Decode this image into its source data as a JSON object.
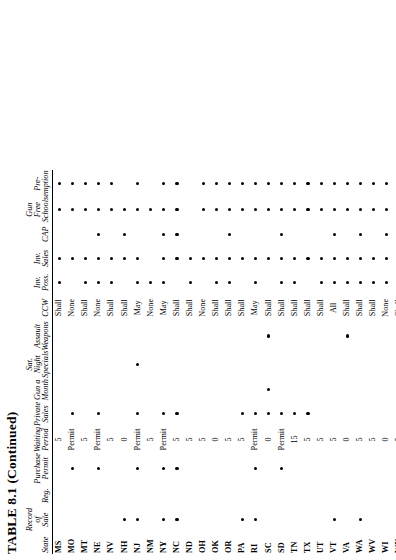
{
  "caption": "TABLE 8.1 (Continued)",
  "columns": [
    {
      "key": "state",
      "label": "State"
    },
    {
      "key": "record",
      "label": "Record\nof\nSale",
      "kind": "dot"
    },
    {
      "key": "reg",
      "label": "Reg.",
      "kind": "dot"
    },
    {
      "key": "permit",
      "label": "Purchase\nPermit",
      "kind": "dot"
    },
    {
      "key": "waiting",
      "label": "Waiting\nPeriod",
      "kind": "text"
    },
    {
      "key": "private",
      "label": "Private\nSales",
      "kind": "dot"
    },
    {
      "key": "gunmonth",
      "label": "Gun a\nMonth",
      "kind": "dot"
    },
    {
      "key": "satnight",
      "label": "Sat.\nNight\nSpecials",
      "kind": "dot"
    },
    {
      "key": "assault",
      "label": "Assault\nWeapons",
      "kind": "dot"
    },
    {
      "key": "ccw",
      "label": "CCW",
      "kind": "text"
    },
    {
      "key": "invposs",
      "label": "Inv.\nPoss.",
      "kind": "dot"
    },
    {
      "key": "invsales",
      "label": "Inv.\nSales",
      "kind": "dot"
    },
    {
      "key": "cap",
      "label": "CAP",
      "kind": "dot"
    },
    {
      "key": "gunfree",
      "label": "Gun\nFree\nSchools",
      "kind": "dot"
    },
    {
      "key": "preempt",
      "label": "Pre-\nemption",
      "kind": "dot"
    }
  ],
  "rows": [
    {
      "state": "MS",
      "record": 0,
      "reg": 0,
      "permit": 0,
      "waiting": "5",
      "private": 0,
      "gunmonth": 0,
      "satnight": 0,
      "assault": 0,
      "ccw": "Shall",
      "invposs": 1,
      "invsales": 1,
      "cap": 0,
      "gunfree": 1,
      "preempt": 1
    },
    {
      "state": "MO",
      "record": 0,
      "reg": 0,
      "permit": 1,
      "waiting": "Permit",
      "private": 1,
      "gunmonth": 0,
      "satnight": 0,
      "assault": 0,
      "ccw": "None",
      "invposs": 0,
      "invsales": 1,
      "cap": 0,
      "gunfree": 1,
      "preempt": 1
    },
    {
      "state": "MT",
      "record": 0,
      "reg": 0,
      "permit": 0,
      "waiting": "5",
      "private": 0,
      "gunmonth": 0,
      "satnight": 0,
      "assault": 0,
      "ccw": "Shall",
      "invposs": 1,
      "invsales": 1,
      "cap": 0,
      "gunfree": 1,
      "preempt": 1
    },
    {
      "state": "NE",
      "record": 0,
      "reg": 0,
      "permit": 1,
      "waiting": "Permit",
      "private": 1,
      "gunmonth": 0,
      "satnight": 0,
      "assault": 0,
      "ccw": "None",
      "invposs": 1,
      "invsales": 1,
      "cap": 1,
      "gunfree": 1,
      "preempt": 1
    },
    {
      "state": "NV",
      "record": 0,
      "reg": 0,
      "permit": 0,
      "waiting": "5",
      "private": 0,
      "gunmonth": 0,
      "satnight": 0,
      "assault": 0,
      "ccw": "Shall",
      "invposs": 1,
      "invsales": 1,
      "cap": 0,
      "gunfree": 1,
      "preempt": 1
    },
    {
      "state": "NH",
      "record": 1,
      "reg": 0,
      "permit": 0,
      "waiting": "0",
      "private": 0,
      "gunmonth": 0,
      "satnight": 0,
      "assault": 0,
      "ccw": "Shall",
      "invposs": 0,
      "invsales": 1,
      "cap": 1,
      "gunfree": 1,
      "preempt": 0
    },
    {
      "state": "NJ",
      "record": 1,
      "reg": 0,
      "permit": 1,
      "waiting": "Permit",
      "private": 1,
      "gunmonth": 0,
      "satnight": 1,
      "assault": 0,
      "ccw": "May",
      "invposs": 1,
      "invsales": 1,
      "cap": 0,
      "gunfree": 1,
      "preempt": 1
    },
    {
      "state": "NM",
      "record": 0,
      "reg": 0,
      "permit": 0,
      "waiting": "5",
      "private": 0,
      "gunmonth": 0,
      "satnight": 0,
      "assault": 0,
      "ccw": "None",
      "invposs": 1,
      "invsales": 0,
      "cap": 0,
      "gunfree": 1,
      "preempt": 0
    },
    {
      "state": "NY",
      "record": 1,
      "reg": 0,
      "permit": 1,
      "waiting": "Permit",
      "private": 1,
      "gunmonth": 0,
      "satnight": 0,
      "assault": 0,
      "ccw": "May",
      "invposs": 1,
      "invsales": 1,
      "cap": 1,
      "gunfree": 1,
      "preempt": 1
    },
    {
      "state": "NC",
      "record": 1,
      "reg": 0,
      "permit": 1,
      "waiting": "5",
      "private": 1,
      "gunmonth": 0,
      "satnight": 0,
      "assault": 0,
      "ccw": "Shall",
      "invposs": 0,
      "invsales": 1,
      "cap": 1,
      "gunfree": 1,
      "preempt": 1
    },
    {
      "state": "ND",
      "record": 0,
      "reg": 0,
      "permit": 0,
      "waiting": "5",
      "private": 0,
      "gunmonth": 0,
      "satnight": 0,
      "assault": 0,
      "ccw": "Shall",
      "invposs": 1,
      "invsales": 1,
      "cap": 0,
      "gunfree": 0,
      "preempt": 0
    },
    {
      "state": "OH",
      "record": 0,
      "reg": 0,
      "permit": 0,
      "waiting": "5",
      "private": 0,
      "gunmonth": 0,
      "satnight": 0,
      "assault": 0,
      "ccw": "None",
      "invposs": 0,
      "invsales": 1,
      "cap": 0,
      "gunfree": 1,
      "preempt": 1
    },
    {
      "state": "OK",
      "record": 0,
      "reg": 0,
      "permit": 0,
      "waiting": "0",
      "private": 0,
      "gunmonth": 0,
      "satnight": 0,
      "assault": 0,
      "ccw": "Shall",
      "invposs": 1,
      "invsales": 1,
      "cap": 0,
      "gunfree": 1,
      "preempt": 1
    },
    {
      "state": "OR",
      "record": 0,
      "reg": 0,
      "permit": 0,
      "waiting": "5",
      "private": 0,
      "gunmonth": 0,
      "satnight": 0,
      "assault": 0,
      "ccw": "Shall",
      "invposs": 1,
      "invsales": 1,
      "cap": 1,
      "gunfree": 1,
      "preempt": 1
    },
    {
      "state": "PA",
      "record": 1,
      "reg": 0,
      "permit": 0,
      "waiting": "5",
      "private": 1,
      "gunmonth": 0,
      "satnight": 0,
      "assault": 0,
      "ccw": "Shall",
      "invposs": 0,
      "invsales": 1,
      "cap": 0,
      "gunfree": 1,
      "preempt": 1
    },
    {
      "state": "RI",
      "record": 1,
      "reg": 0,
      "permit": 1,
      "waiting": "Permit",
      "private": 1,
      "gunmonth": 0,
      "satnight": 0,
      "assault": 0,
      "ccw": "May",
      "invposs": 1,
      "invsales": 1,
      "cap": 0,
      "gunfree": 1,
      "preempt": 1
    },
    {
      "state": "SC",
      "record": 0,
      "reg": 0,
      "permit": 0,
      "waiting": "0",
      "private": 1,
      "gunmonth": 1,
      "satnight": 0,
      "assault": 1,
      "ccw": "Shall",
      "invposs": 0,
      "invsales": 1,
      "cap": 0,
      "gunfree": 1,
      "preempt": 1
    },
    {
      "state": "SD",
      "record": 0,
      "reg": 0,
      "permit": 1,
      "waiting": "Permit",
      "private": 1,
      "gunmonth": 0,
      "satnight": 0,
      "assault": 0,
      "ccw": "Shall",
      "invposs": 1,
      "invsales": 1,
      "cap": 1,
      "gunfree": 1,
      "preempt": 1
    },
    {
      "state": "TN",
      "record": 0,
      "reg": 0,
      "permit": 0,
      "waiting": "15",
      "private": 1,
      "gunmonth": 0,
      "satnight": 0,
      "assault": 0,
      "ccw": "Shall",
      "invposs": 1,
      "invsales": 1,
      "cap": 0,
      "gunfree": 1,
      "preempt": 1
    },
    {
      "state": "TX",
      "record": 0,
      "reg": 0,
      "permit": 0,
      "waiting": "5",
      "private": 1,
      "gunmonth": 0,
      "satnight": 0,
      "assault": 0,
      "ccw": "Shall",
      "invposs": 0,
      "invsales": 1,
      "cap": 0,
      "gunfree": 1,
      "preempt": 1
    },
    {
      "state": "UT",
      "record": 0,
      "reg": 0,
      "permit": 0,
      "waiting": "5",
      "private": 0,
      "gunmonth": 0,
      "satnight": 0,
      "assault": 0,
      "ccw": "Shall",
      "invposs": 1,
      "invsales": 1,
      "cap": 0,
      "gunfree": 1,
      "preempt": 1
    },
    {
      "state": "VT",
      "record": 1,
      "reg": 0,
      "permit": 0,
      "waiting": "5",
      "private": 0,
      "gunmonth": 0,
      "satnight": 0,
      "assault": 0,
      "ccw": "All",
      "invposs": 1,
      "invsales": 1,
      "cap": 1,
      "gunfree": 1,
      "preempt": 1
    },
    {
      "state": "VA",
      "record": 0,
      "reg": 0,
      "permit": 0,
      "waiting": "0",
      "private": 0,
      "gunmonth": 0,
      "satnight": 0,
      "assault": 1,
      "ccw": "Shall",
      "invposs": 1,
      "invsales": 1,
      "cap": 0,
      "gunfree": 1,
      "preempt": 1
    },
    {
      "state": "WA",
      "record": 1,
      "reg": 0,
      "permit": 0,
      "waiting": "5",
      "private": 0,
      "gunmonth": 0,
      "satnight": 0,
      "assault": 0,
      "ccw": "Shall",
      "invposs": 1,
      "invsales": 1,
      "cap": 1,
      "gunfree": 1,
      "preempt": 1
    },
    {
      "state": "WV",
      "record": 0,
      "reg": 0,
      "permit": 0,
      "waiting": "5",
      "private": 0,
      "gunmonth": 0,
      "satnight": 0,
      "assault": 0,
      "ccw": "Shall",
      "invposs": 1,
      "invsales": 1,
      "cap": 0,
      "gunfree": 1,
      "preempt": 1
    },
    {
      "state": "WI",
      "record": 0,
      "reg": 0,
      "permit": 0,
      "waiting": "0",
      "private": 0,
      "gunmonth": 0,
      "satnight": 0,
      "assault": 0,
      "ccw": "None",
      "invposs": 1,
      "invsales": 1,
      "cap": 1,
      "gunfree": 1,
      "preempt": 1
    },
    {
      "state": "WY",
      "record": 1,
      "reg": 0,
      "permit": 0,
      "waiting": "5",
      "private": 0,
      "gunmonth": 0,
      "satnight": 0,
      "assault": 0,
      "ccw": "Shall",
      "invposs": 1,
      "invsales": 0,
      "cap": 0,
      "gunfree": 1,
      "preempt": 1
    }
  ]
}
